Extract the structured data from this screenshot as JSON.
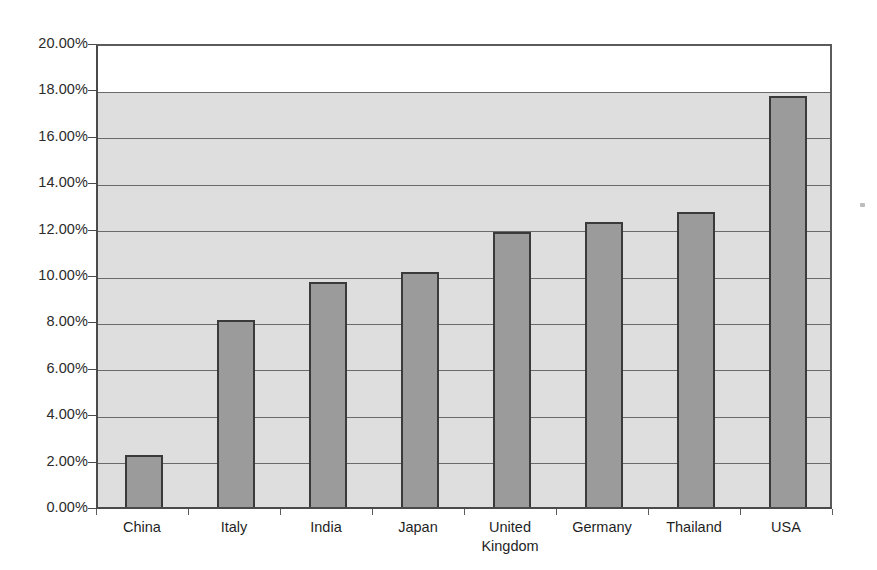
{
  "chart_data": {
    "type": "bar",
    "title": "",
    "subtitle": "",
    "xlabel": "",
    "ylabel": "",
    "categories": [
      "China",
      "Italy",
      "India",
      "Japan",
      "United\nKingdom",
      "Germany",
      "Thailand",
      "USA"
    ],
    "values": [
      2.38,
      8.18,
      9.83,
      10.25,
      12.0,
      12.42,
      12.85,
      17.85
    ],
    "value_labels": [
      "2.38%",
      "8.18%",
      "9.83%",
      "10.25%",
      "12.00%",
      "12.42%",
      "12.85%",
      "17.85%"
    ],
    "ylim": [
      0,
      20
    ],
    "y_tick_labels": [
      "0.00%",
      "2.00%",
      "4.00%",
      "6.00%",
      "8.00%",
      "10.00%",
      "12.00%",
      "14.00%",
      "16.00%",
      "18.00%",
      "20.00%"
    ],
    "y_tick_values": [
      0,
      2,
      4,
      6,
      8,
      10,
      12,
      14,
      16,
      18,
      20
    ],
    "grid": true,
    "grid_axis": "y",
    "legend": false,
    "legend_position": "none",
    "series": [
      {
        "name": "",
        "values": [
          2.38,
          8.18,
          9.83,
          10.25,
          12.0,
          12.42,
          12.85,
          17.85
        ]
      }
    ],
    "colors": {
      "bar_fill": "#9b9b9b",
      "bar_border": "#3a3a3a",
      "plot_background": "#dedede",
      "plot_background_top": "#ffffff",
      "grid_line": "#6a6a6a",
      "axis": "#4a4a4a",
      "text": "#1f1f1f",
      "page_background": "#ffffff"
    }
  }
}
